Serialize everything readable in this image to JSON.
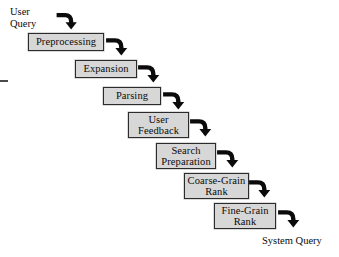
{
  "diagram": {
    "type": "flowchart-cascade",
    "background_color": "#ffffff",
    "node_fill_color": "#d7d7d7",
    "node_border_color": "#2b2b2b",
    "arrow_color": "#0b0b0b",
    "text_color": "#0b0b0b",
    "input_caption": "User\nQuery",
    "output_caption": "System Query",
    "nodes": [
      {
        "id": "preprocessing",
        "label": "Preprocessing",
        "x": 28,
        "y": 33,
        "w": 76,
        "h": 18
      },
      {
        "id": "expansion",
        "label": "Expansion",
        "x": 75,
        "y": 60,
        "w": 62,
        "h": 18
      },
      {
        "id": "parsing",
        "label": "Parsing",
        "x": 103,
        "y": 87,
        "w": 58,
        "h": 18
      },
      {
        "id": "user-feedback",
        "label": "User\nFeedback",
        "x": 128,
        "y": 112,
        "w": 61,
        "h": 26
      },
      {
        "id": "search-preparation",
        "label": "Search\nPreparation",
        "x": 156,
        "y": 143,
        "w": 60,
        "h": 26
      },
      {
        "id": "coarse-grain-rank",
        "label": "Coarse-Grain\nRank",
        "x": 184,
        "y": 173,
        "w": 65,
        "h": 26
      },
      {
        "id": "fine-grain-rank",
        "label": "Fine-Grain\nRank",
        "x": 214,
        "y": 203,
        "w": 62,
        "h": 26
      }
    ],
    "connectors": [
      {
        "id": "query-to-preprocessing",
        "from": "user-query",
        "to": "preprocessing",
        "x": 55,
        "y": 9,
        "size": 25
      },
      {
        "id": "preprocessing-to-expansion",
        "from": "preprocessing",
        "to": "expansion",
        "x": 104,
        "y": 34,
        "size": 27
      },
      {
        "id": "expansion-to-parsing",
        "from": "expansion",
        "to": "parsing",
        "x": 136,
        "y": 61,
        "size": 27
      },
      {
        "id": "parsing-to-user-feedback",
        "from": "parsing",
        "to": "user-feedback",
        "x": 161,
        "y": 88,
        "size": 27
      },
      {
        "id": "user-feedback-to-search-prep",
        "from": "user-feedback",
        "to": "search-preparation",
        "x": 188,
        "y": 115,
        "size": 27
      },
      {
        "id": "search-prep-to-coarse-rank",
        "from": "search-preparation",
        "to": "coarse-grain-rank",
        "x": 215,
        "y": 146,
        "size": 27
      },
      {
        "id": "coarse-rank-to-fine-rank",
        "from": "coarse-grain-rank",
        "to": "fine-grain-rank",
        "x": 247,
        "y": 176,
        "size": 27
      },
      {
        "id": "fine-rank-to-system-query",
        "from": "fine-grain-rank",
        "to": "system-query",
        "x": 276,
        "y": 206,
        "size": 27
      }
    ]
  }
}
